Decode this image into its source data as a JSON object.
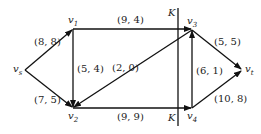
{
  "diagram": {
    "type": "network-flow",
    "nodes": [
      {
        "id": "vs",
        "label": "v",
        "sub": "s",
        "x": 25,
        "y": 70
      },
      {
        "id": "v1",
        "label": "v",
        "sub": "1",
        "x": 73,
        "y": 29
      },
      {
        "id": "v2",
        "label": "v",
        "sub": "2",
        "x": 73,
        "y": 108
      },
      {
        "id": "v3",
        "label": "v",
        "sub": "3",
        "x": 192,
        "y": 30
      },
      {
        "id": "v4",
        "label": "v",
        "sub": "4",
        "x": 192,
        "y": 108
      },
      {
        "id": "vt",
        "label": "v",
        "sub": "t",
        "x": 242,
        "y": 70
      }
    ],
    "edges": [
      {
        "from": "vs",
        "to": "v1",
        "label": "(8, 8)"
      },
      {
        "from": "vs",
        "to": "v2",
        "label": "(7, 5)"
      },
      {
        "from": "v1",
        "to": "v2",
        "label": "(5, 4)"
      },
      {
        "from": "v1",
        "to": "v3",
        "label": "(9, 4)"
      },
      {
        "from": "v3",
        "to": "v2",
        "label": "(2, 0)"
      },
      {
        "from": "v2",
        "to": "v4",
        "label": "(9, 9)"
      },
      {
        "from": "v4",
        "to": "v3",
        "label": "(6, 1)"
      },
      {
        "from": "v3",
        "to": "vt",
        "label": "(5, 5)"
      },
      {
        "from": "v4",
        "to": "vt",
        "label": "(10, 8)"
      }
    ],
    "cut": {
      "label_top": "K",
      "label_bottom": "K"
    }
  }
}
